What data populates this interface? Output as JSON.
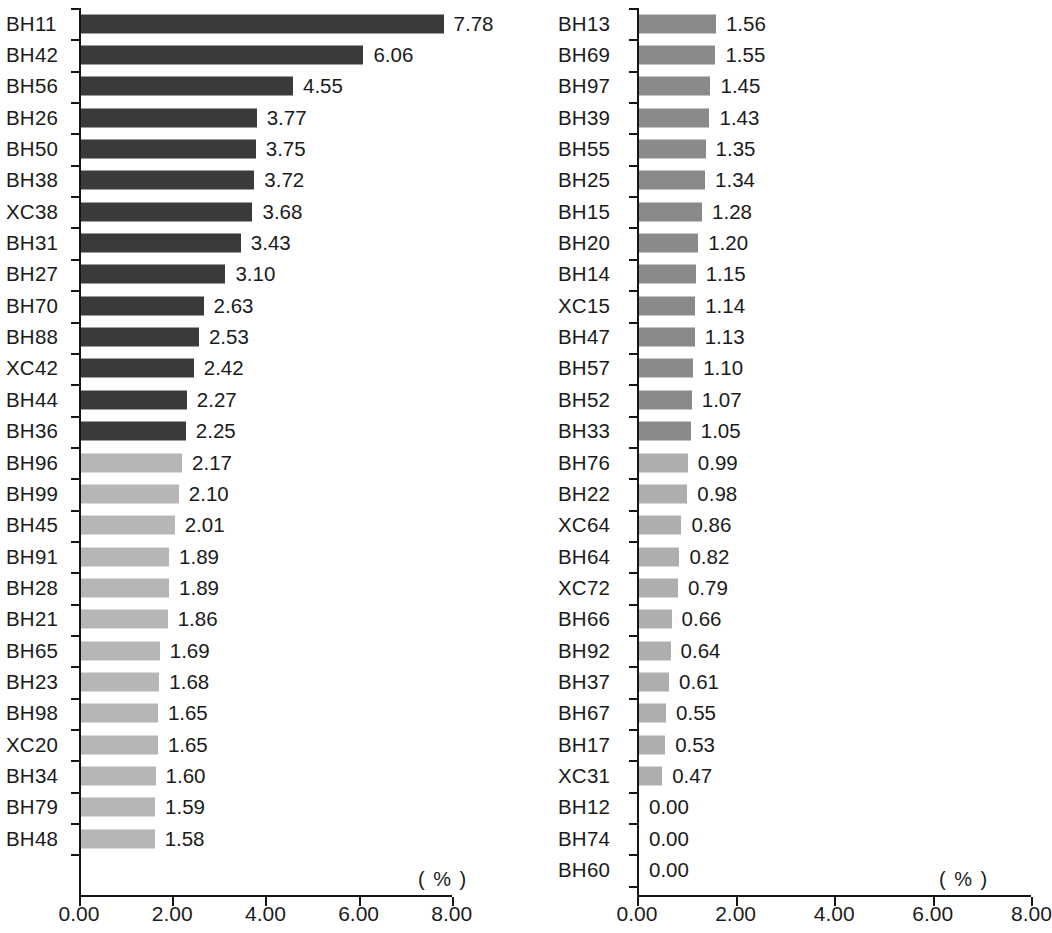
{
  "chart_data": [
    {
      "type": "bar",
      "orientation": "horizontal",
      "panel": "left",
      "title": "",
      "xlabel": "( % )",
      "ylabel": "",
      "xlim": [
        0.0,
        8.0
      ],
      "xticks": [
        0.0,
        2.0,
        4.0,
        6.0,
        8.0
      ],
      "xticklabels": [
        "0.00",
        "2.00",
        "4.00",
        "6.00",
        "8.00"
      ],
      "grid": false,
      "legend": "none",
      "categories": [
        "BH11",
        "BH42",
        "BH56",
        "BH26",
        "BH50",
        "BH38",
        "XC38",
        "BH31",
        "BH27",
        "BH70",
        "BH88",
        "XC42",
        "BH44",
        "BH36",
        "BH96",
        "BH99",
        "BH45",
        "BH91",
        "BH28",
        "BH21",
        "BH65",
        "BH23",
        "BH98",
        "XC20",
        "BH34",
        "BH79",
        "BH48"
      ],
      "values": [
        7.78,
        6.06,
        4.55,
        3.77,
        3.75,
        3.72,
        3.68,
        3.43,
        3.1,
        2.63,
        2.53,
        2.42,
        2.27,
        2.25,
        2.17,
        2.1,
        2.01,
        1.89,
        1.89,
        1.86,
        1.69,
        1.68,
        1.65,
        1.65,
        1.6,
        1.59,
        1.58
      ],
      "value_labels": [
        "7.78",
        "6.06",
        "4.55",
        "3.77",
        "3.75",
        "3.72",
        "3.68",
        "3.43",
        "3.10",
        "2.63",
        "2.53",
        "2.42",
        "2.27",
        "2.25",
        "2.17",
        "2.10",
        "2.01",
        "1.89",
        "1.89",
        "1.86",
        "1.69",
        "1.68",
        "1.65",
        "1.65",
        "1.60",
        "1.59",
        "1.58"
      ],
      "bar_colors": [
        "#3a3a3a",
        "#3a3a3a",
        "#3a3a3a",
        "#3a3a3a",
        "#3a3a3a",
        "#3a3a3a",
        "#3a3a3a",
        "#3a3a3a",
        "#3a3a3a",
        "#3a3a3a",
        "#3a3a3a",
        "#3a3a3a",
        "#3a3a3a",
        "#3a3a3a",
        "#b6b6b6",
        "#b6b6b6",
        "#b6b6b6",
        "#b6b6b6",
        "#b6b6b6",
        "#b6b6b6",
        "#b6b6b6",
        "#b6b6b6",
        "#b6b6b6",
        "#b6b6b6",
        "#b6b6b6",
        "#b6b6b6",
        "#b6b6b6"
      ]
    },
    {
      "type": "bar",
      "orientation": "horizontal",
      "panel": "right",
      "title": "",
      "xlabel": "( % )",
      "ylabel": "",
      "xlim": [
        0.0,
        8.0
      ],
      "xticks": [
        0.0,
        2.0,
        4.0,
        6.0,
        8.0
      ],
      "xticklabels": [
        "0.00",
        "2.00",
        "4.00",
        "6.00",
        "8.00"
      ],
      "grid": false,
      "legend": "none",
      "categories": [
        "BH13",
        "BH69",
        "BH97",
        "BH39",
        "BH55",
        "BH25",
        "BH15",
        "BH20",
        "BH14",
        "XC15",
        "BH47",
        "BH57",
        "BH52",
        "BH33",
        "BH76",
        "BH22",
        "XC64",
        "BH64",
        "XC72",
        "BH66",
        "BH92",
        "BH37",
        "BH67",
        "BH17",
        "XC31",
        "BH12",
        "BH74",
        "BH60"
      ],
      "values": [
        1.56,
        1.55,
        1.45,
        1.43,
        1.35,
        1.34,
        1.28,
        1.2,
        1.15,
        1.14,
        1.13,
        1.1,
        1.07,
        1.05,
        0.99,
        0.98,
        0.86,
        0.82,
        0.79,
        0.66,
        0.64,
        0.61,
        0.55,
        0.53,
        0.47,
        0.0,
        0.0,
        0.0
      ],
      "value_labels": [
        "1.56",
        "1.55",
        "1.45",
        "1.43",
        "1.35",
        "1.34",
        "1.28",
        "1.20",
        "1.15",
        "1.14",
        "1.13",
        "1.10",
        "1.07",
        "1.05",
        "0.99",
        "0.98",
        "0.86",
        "0.82",
        "0.79",
        "0.66",
        "0.64",
        "0.61",
        "0.55",
        "0.53",
        "0.47",
        "0.00",
        "0.00",
        "0.00"
      ],
      "bar_colors": [
        "#8a8a8a",
        "#8a8a8a",
        "#8a8a8a",
        "#8a8a8a",
        "#8a8a8a",
        "#8a8a8a",
        "#8a8a8a",
        "#8a8a8a",
        "#8a8a8a",
        "#8a8a8a",
        "#8a8a8a",
        "#8a8a8a",
        "#8a8a8a",
        "#8a8a8a",
        "#aeaeae",
        "#aeaeae",
        "#aeaeae",
        "#aeaeae",
        "#aeaeae",
        "#aeaeae",
        "#aeaeae",
        "#aeaeae",
        "#aeaeae",
        "#aeaeae",
        "#aeaeae",
        "#aeaeae",
        "#aeaeae",
        "#aeaeae"
      ]
    }
  ],
  "panels": {
    "left": {
      "unit_label": "( % )",
      "axis_tick_labels": [
        "0.00",
        "2.00",
        "4.00",
        "6.00",
        "8.00"
      ]
    },
    "right": {
      "unit_label": "( % )",
      "axis_tick_labels": [
        "0.00",
        "2.00",
        "4.00",
        "6.00",
        "8.00"
      ]
    }
  }
}
